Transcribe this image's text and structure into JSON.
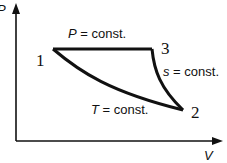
{
  "axes": {
    "y_label": "P",
    "x_label": "V"
  },
  "points": [
    {
      "id": "1",
      "label": "1"
    },
    {
      "id": "2",
      "label": "2"
    },
    {
      "id": "3",
      "label": "3"
    }
  ],
  "processes": {
    "isobaric": {
      "var": "P",
      "text": " = const."
    },
    "isentropic": {
      "var": "s",
      "text": " = const."
    },
    "isothermal": {
      "var": "T",
      "text": " = const."
    }
  },
  "colors": {
    "line": "#111111",
    "background": "#ffffff"
  }
}
